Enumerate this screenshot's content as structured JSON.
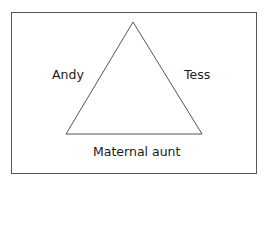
{
  "diagram": {
    "type": "triangle",
    "nodes": {
      "left": "Andy",
      "right": "Tess",
      "bottom": "Maternal aunt"
    },
    "colors": {
      "line": "#555555",
      "text": "#1a1a1a",
      "background": "#ffffff"
    }
  }
}
